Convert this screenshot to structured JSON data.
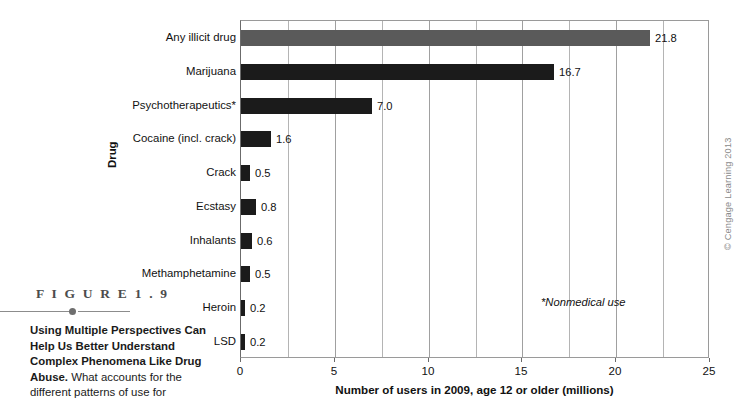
{
  "figure": {
    "number_label": "F I G U R E   1 . 9",
    "caption_lead": "Using Multiple Perspectives Can Help Us Better Understand Complex Phenomena Like Drug Abuse.",
    "caption_rest": " What accounts for the different patterns of use for"
  },
  "chart_data": {
    "type": "bar",
    "orientation": "horizontal",
    "title": "",
    "xlabel": "Number of users in 2009, age 12 or older (millions)",
    "ylabel": "Drug",
    "xlim": [
      0,
      25
    ],
    "xticks": [
      0,
      5,
      10,
      15,
      20,
      25
    ],
    "xtick_labels": [
      "0",
      "5",
      "10",
      "15",
      "20",
      "25"
    ],
    "gridlines_minor_step": 2.5,
    "grid": true,
    "legend": "none",
    "categories": [
      "Any illicit drug",
      "Marijuana",
      "Psychotherapeutics*",
      "Cocaine (incl. crack)",
      "Crack",
      "Ecstasy",
      "Inhalants",
      "Methamphetamine",
      "Heroin",
      "LSD"
    ],
    "values": [
      21.8,
      16.7,
      7.0,
      1.6,
      0.5,
      0.8,
      0.6,
      0.5,
      0.2,
      0.2
    ],
    "value_labels": [
      "21.8",
      "16.7",
      "7.0",
      "1.6",
      "0.5",
      "0.8",
      "0.6",
      "0.5",
      "0.2",
      "0.2"
    ],
    "bar_colors": [
      "#5a5a5a",
      "#1b1b1b",
      "#1b1b1b",
      "#1b1b1b",
      "#1b1b1b",
      "#1b1b1b",
      "#1b1b1b",
      "#1b1b1b",
      "#1b1b1b",
      "#1b1b1b"
    ],
    "highlight_index": 0,
    "annotation": "*Nonmedical use"
  },
  "credit": "© Cengage Learning 2013"
}
